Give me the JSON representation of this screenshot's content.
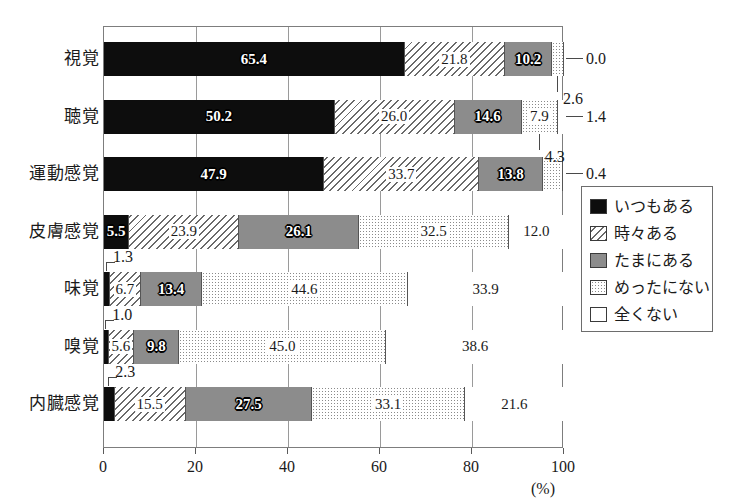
{
  "chart_data": {
    "type": "bar",
    "orientation": "horizontal",
    "stacked": true,
    "stack_mode": "percent",
    "title": "",
    "xlabel": "(%)",
    "ylabel": "",
    "xlim": [
      0,
      100
    ],
    "xticks": [
      "0",
      "20",
      "40",
      "60",
      "80",
      "100"
    ],
    "grid": true,
    "legend_position": "right",
    "categories": [
      "視覚",
      "聴覚",
      "運動感覚",
      "皮膚感覚",
      "味覚",
      "嗅覚",
      "内臓感覚"
    ],
    "series": [
      {
        "name": "いつもある",
        "pattern": "solid-black",
        "values": [
          65.4,
          50.2,
          47.9,
          5.5,
          1.3,
          1.0,
          2.3
        ]
      },
      {
        "name": "時々ある",
        "pattern": "diagonal-hatch",
        "values": [
          21.8,
          26.0,
          33.7,
          23.9,
          6.7,
          5.6,
          15.5
        ]
      },
      {
        "name": "たまにある",
        "pattern": "solid-gray",
        "values": [
          10.2,
          14.6,
          13.8,
          26.1,
          13.4,
          9.8,
          27.5
        ]
      },
      {
        "name": "めったにない",
        "pattern": "dotted",
        "values": [
          2.6,
          7.9,
          4.3,
          32.5,
          44.6,
          45.0,
          33.1
        ]
      },
      {
        "name": "全くない",
        "pattern": "white",
        "values": [
          0.0,
          1.4,
          0.4,
          12.0,
          33.9,
          38.6,
          21.6
        ]
      }
    ],
    "colors": {
      "always": "#0d0d0d",
      "sometimes_gray": "#8c8c8c",
      "hatch_line": "#6a6a6a",
      "dot": "#8a8a8a",
      "never_white": "#ffffff",
      "axis": "#7d7d7d",
      "grid": "#9a9a9a"
    },
    "callout_labels": [
      {
        "row": 0,
        "series": 4,
        "text": "0.0",
        "side": "right"
      },
      {
        "row": 0,
        "series": 3,
        "text": "2.6",
        "side": "below"
      },
      {
        "row": 1,
        "series": 4,
        "text": "1.4",
        "side": "right"
      },
      {
        "row": 1,
        "series": 3,
        "text": "4.3",
        "side": "below"
      },
      {
        "row": 2,
        "series": 4,
        "text": "0.4",
        "side": "right"
      },
      {
        "row": 4,
        "series": 0,
        "text": "1.3",
        "side": "above"
      },
      {
        "row": 5,
        "series": 0,
        "text": "1.0",
        "side": "above"
      },
      {
        "row": 6,
        "series": 0,
        "text": "2.3",
        "side": "above"
      }
    ],
    "inline_labels": [
      [
        "65.4",
        "21.8",
        "10.2",
        "",
        ""
      ],
      [
        "50.2",
        "26.0",
        "14.6",
        "7.9",
        ""
      ],
      [
        "47.9",
        "33.7",
        "13.8",
        "",
        ""
      ],
      [
        "5.5",
        "23.9",
        "26.1",
        "32.5",
        "12.0"
      ],
      [
        "",
        "6.7",
        "13.4",
        "44.6",
        "33.9"
      ],
      [
        "",
        "5.6",
        "9.8",
        "45.0",
        "38.6"
      ],
      [
        "",
        "15.5",
        "27.5",
        "33.1",
        "21.6"
      ]
    ]
  },
  "legend": {
    "items": [
      {
        "label": "いつもある",
        "pattern": "p-always"
      },
      {
        "label": "時々ある",
        "pattern": "p-often"
      },
      {
        "label": "たまにある",
        "pattern": "p-sometimes"
      },
      {
        "label": "めったにない",
        "pattern": "p-rarely"
      },
      {
        "label": "全くない",
        "pattern": "p-never"
      }
    ]
  },
  "axis": {
    "ticks": [
      "0",
      "20",
      "40",
      "60",
      "80",
      "100"
    ],
    "unit": "(%)"
  },
  "header": {
    "clipped_text": ""
  }
}
